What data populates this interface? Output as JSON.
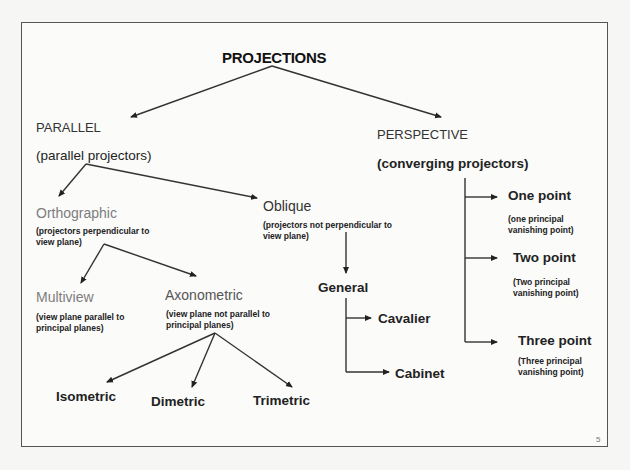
{
  "slide": {
    "title": "PROJECTIONS",
    "page_number": "5",
    "parallel": {
      "label": "PARALLEL",
      "desc": "(parallel projectors)",
      "orthographic": {
        "label": "Orthographic",
        "desc": "(projectors perpendicular to view plane)",
        "multiview": {
          "label": "Multiview",
          "desc": "(view plane parallel to principal planes)"
        },
        "axonometric": {
          "label": "Axonometric",
          "desc": "(view plane not parallel to principal planes)",
          "children": [
            "Isometric",
            "Dimetric",
            "Trimetric"
          ]
        }
      },
      "oblique": {
        "label": "Oblique",
        "desc": "(projectors not perpendicular to view plane)",
        "general": {
          "label": "General",
          "children": [
            "Cavalier",
            "Cabinet"
          ]
        }
      }
    },
    "perspective": {
      "label": "PERSPECTIVE",
      "desc": "(converging projectors)",
      "children": [
        {
          "label": "One point",
          "desc": "(one principal vanishing point)"
        },
        {
          "label": "Two point",
          "desc": "(Two principal vanishing point)"
        },
        {
          "label": "Three point",
          "desc": "(Three principal vanishing point)"
        }
      ]
    }
  }
}
